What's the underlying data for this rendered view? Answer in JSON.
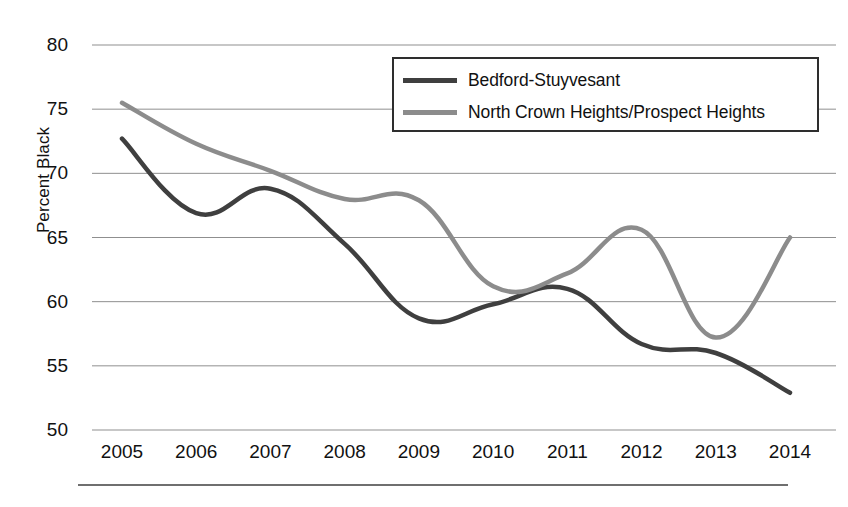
{
  "chart_data": {
    "type": "line",
    "title": "",
    "xlabel": "",
    "ylabel": "Percent Black",
    "x": [
      2005,
      2006,
      2007,
      2008,
      2009,
      2010,
      2011,
      2012,
      2013,
      2014
    ],
    "xticklabels": [
      "2005",
      "2006",
      "2007",
      "2008",
      "2009",
      "2010",
      "2011",
      "2012",
      "2013",
      "2014"
    ],
    "yticklabels": [
      "80",
      "75",
      "70",
      "65",
      "60",
      "55",
      "50"
    ],
    "yticks": [
      80,
      75,
      70,
      65,
      60,
      55,
      50
    ],
    "ylim": [
      50,
      80
    ],
    "xlim": [
      2005,
      2014
    ],
    "grid": "horizontal",
    "legend_position": "top-right",
    "series": [
      {
        "name": "Bedford-Stuyvesant",
        "color": "#3f3f3f",
        "values": [
          72.7,
          66.9,
          68.8,
          64.5,
          58.7,
          59.8,
          61.0,
          56.7,
          56.0,
          52.9
        ]
      },
      {
        "name": "North Crown Heights/Prospect Heights",
        "color": "#8c8c8c",
        "values": [
          75.5,
          72.3,
          70.2,
          68.0,
          67.9,
          61.2,
          62.2,
          65.6,
          57.2,
          65.0
        ]
      }
    ]
  },
  "legend": {
    "items": [
      {
        "label": "Bedford-Stuyvesant",
        "color": "#3f3f3f"
      },
      {
        "label": "North Crown Heights/Prospect Heights",
        "color": "#8c8c8c"
      }
    ]
  },
  "colors": {
    "gridline": "#8f8f8f",
    "axis_text": "#111111",
    "legend_border": "#2e2e2e",
    "footer_rule": "#6f6f6f",
    "background": "#ffffff"
  }
}
